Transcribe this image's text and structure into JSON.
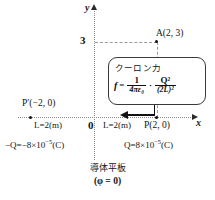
{
  "figure": {
    "background_color": "#ffffff",
    "line_color": "#2b2b2b",
    "guide_color": "#9a9a9a"
  },
  "axes": {
    "y_label": "y",
    "x_label": "x",
    "origin_label": "0",
    "y_tick_label": "3"
  },
  "points": {
    "a_label": "A(2, 3)",
    "p_prime_label": "P′(−2, 0)",
    "p_label": "P(2, 0)"
  },
  "distances": {
    "left": "L=2(m)",
    "right": "L=2(m)"
  },
  "charges": {
    "negative": {
      "prefix": "−Q=−8×10",
      "exponent": "−5",
      "unit": "(C)"
    },
    "positive": {
      "prefix": "Q=8×10",
      "exponent": "−5",
      "unit": "(C)"
    }
  },
  "callout": {
    "title": "クーロン力",
    "f_symbol": "f",
    "equals": "=",
    "frac1_numerator": "1",
    "frac1_denominator": "4πε₀",
    "operator": "·",
    "frac2_numerator": "Q²",
    "frac2_denominator": "(2L)²"
  },
  "plate": {
    "name": "導体平板",
    "potential": "(φ = 0)"
  }
}
